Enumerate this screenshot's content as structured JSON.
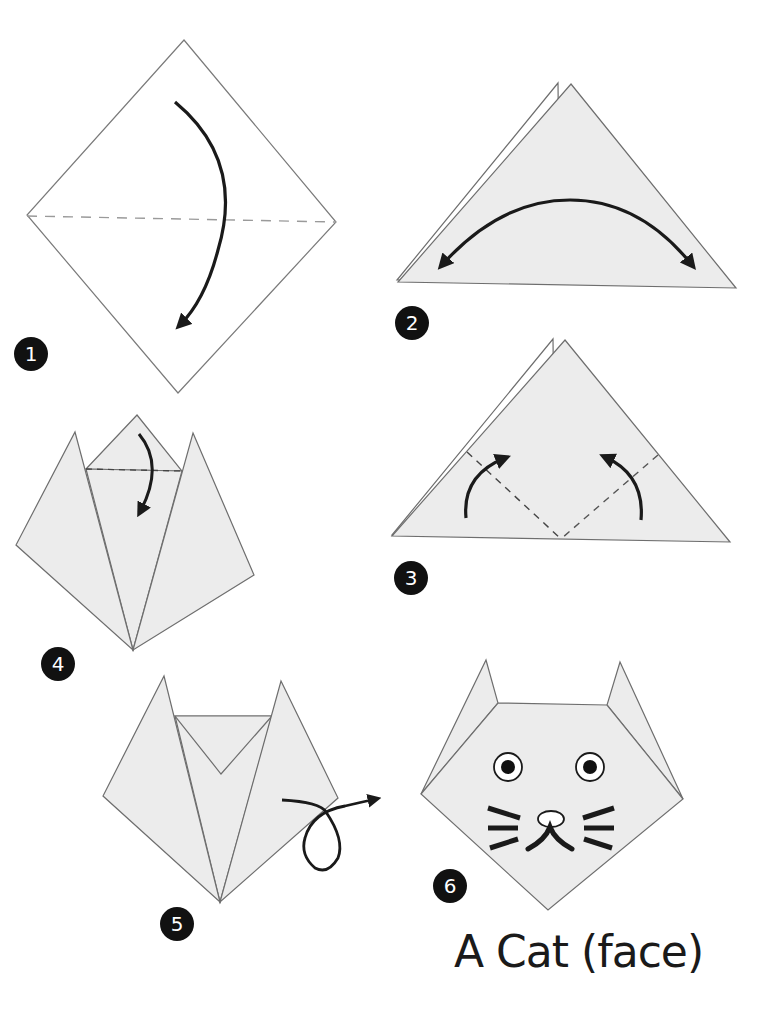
{
  "title": "A Cat (face)",
  "colors": {
    "paper_fill": "#ececec",
    "paper_edge": "#6e6e6e",
    "arrow": "#1a1a1a",
    "badge": "#111111",
    "fold_line": "#8a8a8a"
  },
  "steps": [
    {
      "number": "1",
      "description": "Square turned as a diamond; fold top corner down along horizontal dashed valley line"
    },
    {
      "number": "2",
      "description": "Triangle; fold in half left-right and unfold (double-headed arrow)"
    },
    {
      "number": "3",
      "description": "Triangle; fold both bottom corners up along dashed lines"
    },
    {
      "number": "4",
      "description": "Ears formed; fold top flap down along dashed line"
    },
    {
      "number": "5",
      "description": "Turn model over (loop arrow)"
    },
    {
      "number": "6",
      "description": "Finished cat face with eyes, nose, mouth and whiskers"
    }
  ]
}
